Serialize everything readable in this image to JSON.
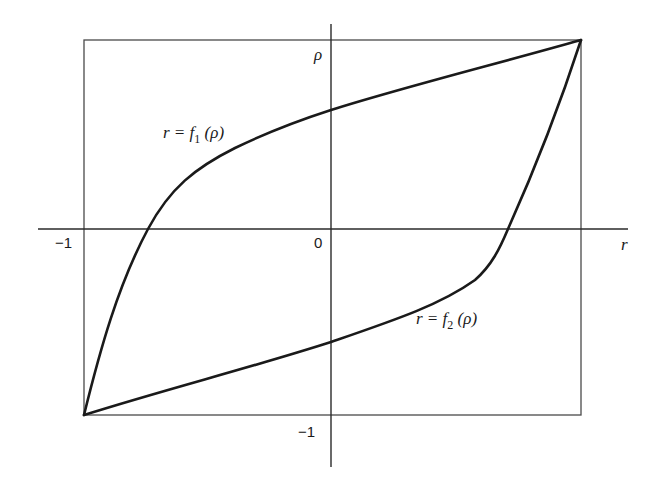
{
  "diagram": {
    "axes": {
      "horizontal_label": "r",
      "vertical_label": "ρ",
      "origin_label": "0",
      "neg_one_r_label": "−1",
      "neg_one_rho_label": "−1"
    },
    "curves": [
      {
        "id": "f1",
        "label_prefix": "r = f",
        "label_sub": "1",
        "label_suffix": " (ρ)",
        "description": "concave curve from (−1,−1) through r-axis near r≈−0.75, ρ-axis near ρ≈0.6, to (1,1)"
      },
      {
        "id": "f2",
        "label_prefix": "r = f",
        "label_sub": "2",
        "label_suffix": " (ρ)",
        "description": "convex curve from (−1,−1) through ρ-axis near ρ≈−0.6, r-axis near r≈0.72, to (1,1)"
      }
    ],
    "box": {
      "r_range": [
        -1,
        1
      ],
      "rho_range": [
        -1,
        1
      ]
    },
    "stroke_color": "#1a1a1a",
    "frame_color": "#4a4a4a"
  }
}
